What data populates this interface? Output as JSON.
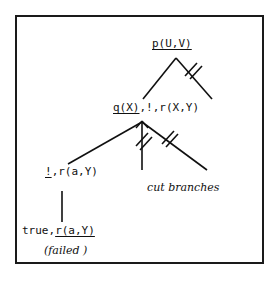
{
  "figure": {
    "type": "sld-resolution-tree",
    "frame": {
      "border_color": "#1a1a1a",
      "background": "#ffffff"
    }
  },
  "nodes": [
    {
      "id": "goal-p",
      "text": "p(U,V)",
      "selected_literal": "p(U,V)",
      "underlined": true,
      "x": 176,
      "y": 45
    },
    {
      "id": "goal-q",
      "text": "q(X),!,r(X,Y)",
      "selected_literal": "q(X)",
      "underlined": true,
      "x": 155,
      "y": 109
    },
    {
      "id": "goal-cut",
      "text": "!,r(a,Y)",
      "selected_literal": "!",
      "underlined": true,
      "x": 68,
      "y": 173
    },
    {
      "id": "goal-true",
      "text": "true,r(a,Y)",
      "selected_literal": "r(a,Y)",
      "underlined": true,
      "x": 75,
      "y": 232
    }
  ],
  "annotations": [
    {
      "id": "failed",
      "text": "(failed )",
      "style": "italic-serif"
    },
    {
      "id": "cut-branches",
      "text": "cut branches",
      "style": "italic-serif"
    }
  ],
  "edges": [
    {
      "from": "goal-p",
      "to": "goal-q",
      "cut": false
    },
    {
      "from": "goal-p",
      "to": "dead-1",
      "cut": true
    },
    {
      "from": "goal-q",
      "to": "goal-cut",
      "cut": false
    },
    {
      "from": "goal-q",
      "to": "dead-2",
      "cut": true
    },
    {
      "from": "goal-q",
      "to": "dead-3",
      "cut": true
    },
    {
      "from": "goal-cut",
      "to": "goal-true",
      "cut": false
    }
  ],
  "colors": {
    "ink": "#101010",
    "frame": "#1a1a1a",
    "paper": "#ffffff"
  }
}
